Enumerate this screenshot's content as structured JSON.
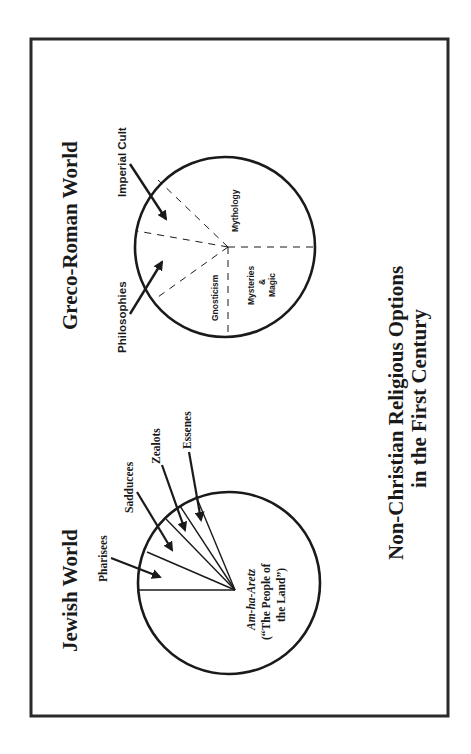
{
  "diagram": {
    "title_line1": "Non-Christian Religious Options",
    "title_line2": "in the First Century",
    "greco_roman": {
      "heading": "Greco-Roman World",
      "influences": [
        {
          "label": "Imperial Cult"
        },
        {
          "label": "Philosophies"
        }
      ],
      "segments": [
        {
          "label": "Mythology"
        },
        {
          "label": "Gnosticism"
        },
        {
          "label": "Mysteries"
        },
        {
          "label": "&"
        },
        {
          "label": "Magic"
        }
      ]
    },
    "jewish": {
      "heading": "Jewish World",
      "groups": [
        {
          "label": "Pharisees"
        },
        {
          "label": "Sadducees"
        },
        {
          "label": "Zealots"
        },
        {
          "label": "Essenes"
        }
      ],
      "majority": {
        "line1": "Am-ha-Aretz",
        "line2": "(“The People of",
        "line3": "the Land”)"
      }
    },
    "colors": {
      "ink": "#1a1a1a",
      "frame": "#2a2a2a",
      "background": "#ffffff"
    }
  }
}
